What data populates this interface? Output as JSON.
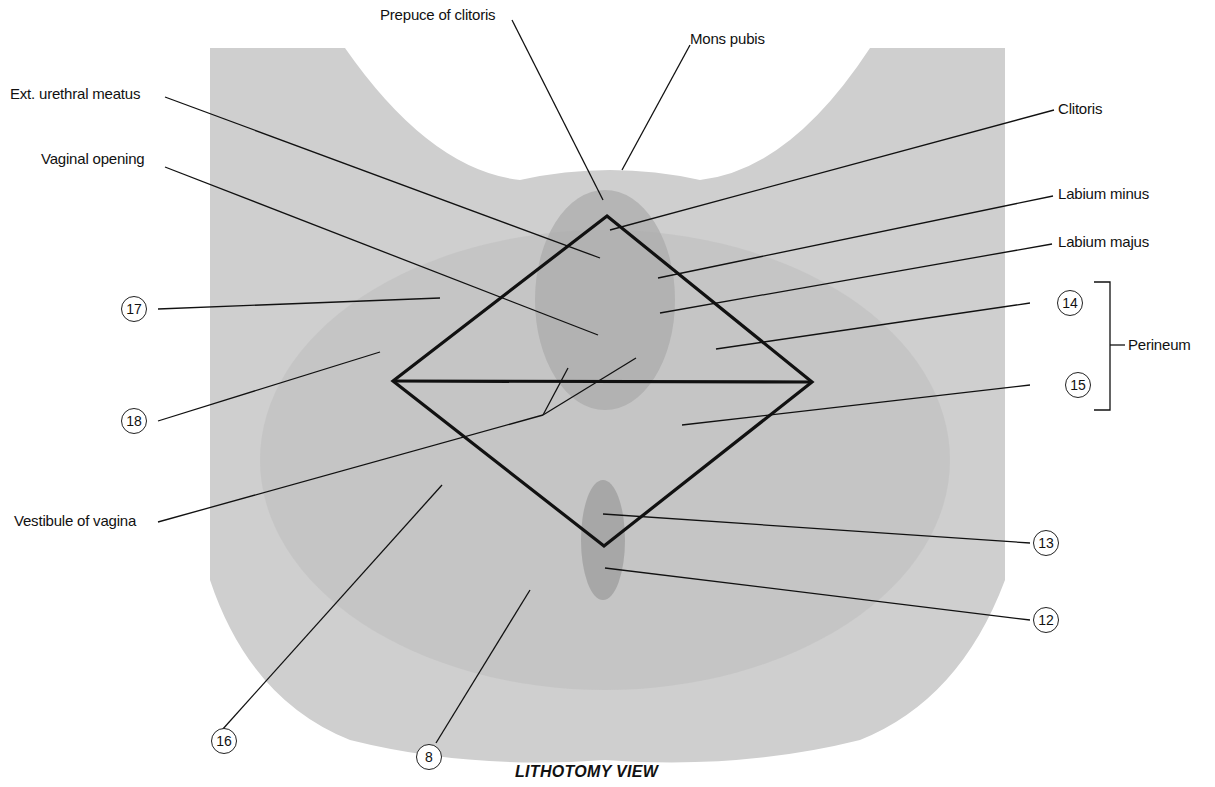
{
  "figure": {
    "caption": "LITHOTOMY VIEW",
    "colors": {
      "background": "#ffffff",
      "plate": "#cfcfcf",
      "plate_dark": "#b0b0b0",
      "lines": "#111111"
    }
  },
  "labels": {
    "prepuce_of_clitoris": "Prepuce of clitoris",
    "mons_pubis": "Mons pubis",
    "ext_urethral_meatus": "Ext. urethral meatus",
    "clitoris": "Clitoris",
    "vaginal_opening": "Vaginal opening",
    "labium_minus": "Labium minus",
    "labium_majus": "Labium majus",
    "perineum": "Perineum",
    "vestibule_of_vagina": "Vestibule of vagina"
  },
  "callouts": {
    "n8": "8",
    "n12": "12",
    "n13": "13",
    "n14": "14",
    "n15": "15",
    "n16": "16",
    "n17": "17",
    "n18": "18"
  }
}
